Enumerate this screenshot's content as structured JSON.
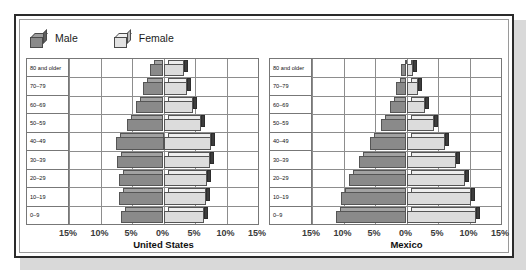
{
  "legend": {
    "items": [
      {
        "label": "Male",
        "icon": "cube-icon",
        "color": "#8a8a8a"
      },
      {
        "label": "Female",
        "icon": "cube-icon",
        "color": "#dcdcdc"
      }
    ]
  },
  "chart_data": [
    {
      "type": "bar",
      "title": "United States",
      "subtype": "population-pyramid",
      "xlabel": "",
      "ylabel": "",
      "xlim": [
        -15,
        15
      ],
      "xticks": [
        -15,
        -10,
        -5,
        0,
        5,
        10,
        15
      ],
      "xtick_labels": [
        "15%",
        "10%",
        "5%",
        "0%",
        "5%",
        "10%",
        "15%"
      ],
      "grid": true,
      "legend_position": "top-left",
      "categories": [
        "80 and older",
        "70–79",
        "60–69",
        "50–59",
        "40–49",
        "30–39",
        "20–29",
        "10–19",
        "0–9"
      ],
      "series": [
        {
          "name": "Male",
          "color": "#8a8a8a",
          "values": [
            2.2,
            3.2,
            4.3,
            5.8,
            7.5,
            7.4,
            7.0,
            7.1,
            6.8
          ]
        },
        {
          "name": "Female",
          "color": "#dcdcdc",
          "values": [
            3.2,
            3.8,
            4.7,
            6.0,
            7.6,
            7.4,
            6.9,
            6.8,
            6.5
          ]
        }
      ]
    },
    {
      "type": "bar",
      "title": "Mexico",
      "subtype": "population-pyramid",
      "xlabel": "",
      "ylabel": "",
      "xlim": [
        -15,
        15
      ],
      "xticks": [
        -15,
        -10,
        -5,
        0,
        5,
        10,
        15
      ],
      "xtick_labels": [
        "15%",
        "10%",
        "5%",
        "0%",
        "5%",
        "10%",
        "15%"
      ],
      "grid": true,
      "legend_position": "top-left",
      "categories": [
        "80 and older",
        "70–79",
        "60–69",
        "50–59",
        "40–49",
        "30–39",
        "20–29",
        "10–19",
        "0–9"
      ],
      "series": [
        {
          "name": "Male",
          "color": "#8a8a8a",
          "values": [
            0.8,
            1.6,
            2.6,
            4.0,
            5.8,
            7.6,
            9.2,
            10.4,
            11.2
          ]
        },
        {
          "name": "Female",
          "color": "#dcdcdc",
          "values": [
            1.1,
            1.9,
            2.9,
            4.3,
            6.1,
            7.8,
            9.3,
            10.3,
            11.0
          ]
        }
      ]
    }
  ]
}
